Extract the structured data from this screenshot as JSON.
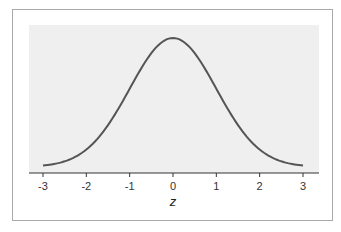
{
  "chart_data": {
    "type": "line",
    "title": "",
    "xlabel": "z",
    "ylabel": "",
    "xlim": [
      -3.3,
      3.3
    ],
    "ylim": [
      0,
      0.42
    ],
    "grid": false,
    "legend": null,
    "x_ticks": [
      -3,
      -2,
      -1,
      0,
      1,
      2,
      3
    ],
    "x_tick_labels": [
      "-3",
      "-2",
      "-1",
      "0",
      "1",
      "2",
      "3"
    ],
    "series": [
      {
        "name": "standard normal density",
        "x": [
          -3,
          -2.5,
          -2,
          -1.5,
          -1,
          -0.5,
          0,
          0.5,
          1,
          1.5,
          2,
          2.5,
          3
        ],
        "values": [
          0.0044,
          0.0175,
          0.054,
          0.1295,
          0.242,
          0.3521,
          0.3989,
          0.3521,
          0.242,
          0.1295,
          0.054,
          0.0175,
          0.0044
        ]
      }
    ],
    "colors": {
      "curve": "#555555",
      "plot_background": "#efefef",
      "axis": "#333333",
      "frame": "#a9a9a9"
    }
  }
}
